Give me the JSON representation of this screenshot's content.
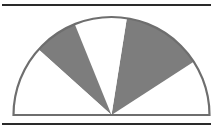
{
  "diagram": {
    "type": "semicircle-sector-diagram",
    "colors": {
      "background": "#ffffff",
      "shade": "#7d7d7d",
      "stroke": "#6e6e6e",
      "rule": "#2a2a2a"
    },
    "center": {
      "x": 111.5,
      "y": 115
    },
    "radius": 98,
    "rules": [
      {
        "y": 5,
        "x1": 2,
        "x2": 211
      },
      {
        "y": 124,
        "x1": 2,
        "x2": 211
      }
    ],
    "sectors": [
      {
        "from_deg": 0,
        "to_deg": 33,
        "shaded": false
      },
      {
        "from_deg": 33,
        "to_deg": 81,
        "shaded": true
      },
      {
        "from_deg": 81,
        "to_deg": 112,
        "shaded": false
      },
      {
        "from_deg": 112,
        "to_deg": 138,
        "shaded": true
      },
      {
        "from_deg": 138,
        "to_deg": 180,
        "shaded": false
      }
    ]
  }
}
